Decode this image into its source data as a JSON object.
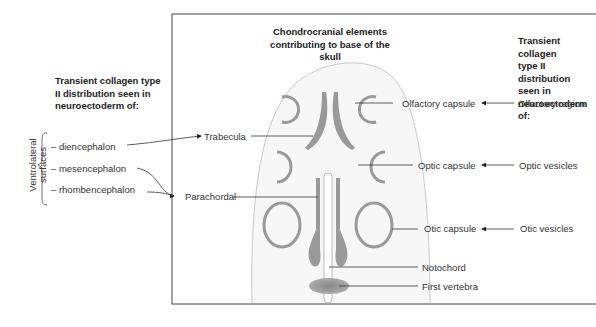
{
  "center_title": [
    "Chondrocranial elements",
    "contributing to base of the skull"
  ],
  "left_heading": [
    "Transient collagen type",
    "II distribution seen in",
    "neuroectoderm of:"
  ],
  "right_heading": [
    "Transient collagen",
    "type II distribution",
    "seen in",
    "neuroectoderm of:"
  ],
  "bracket_label": [
    "Ventrolateral",
    "surfaces"
  ],
  "left_items": [
    "– diencephalon",
    "– mesencephalon",
    "– rhombencephalon"
  ],
  "inner_labels": {
    "trabecula": "Trabecula",
    "parachordal": "Parachordal",
    "olfactory_capsule": "Olfactory capsule",
    "optic_capsule": "Optic capsule",
    "otic_capsule": "Otic capsule",
    "notochord": "Notochord",
    "first_vertebra": "First vertebra"
  },
  "right_labels": {
    "olfactory_region": "Olfactory region",
    "optic_vesicles": "Optic vesicles",
    "otic_vesicles": "Otic vesicles"
  }
}
